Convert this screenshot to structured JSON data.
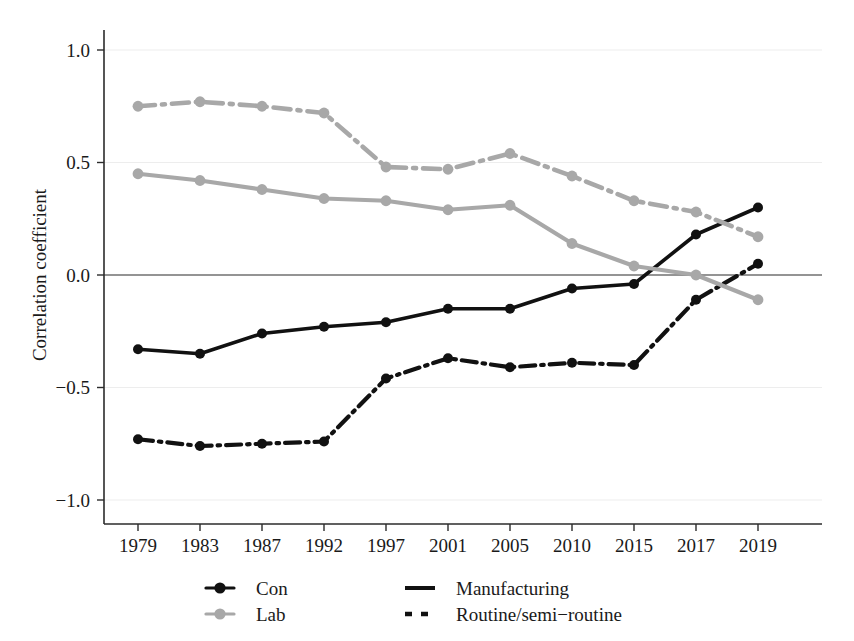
{
  "chart_data": {
    "type": "line",
    "title": "",
    "xlabel": "",
    "ylabel": "Correlation coefficient",
    "grid": true,
    "legend_position": "bottom",
    "categories": [
      "1979",
      "1983",
      "1987",
      "1992",
      "1997",
      "2001",
      "2005",
      "2010",
      "2015",
      "2017",
      "2019"
    ],
    "ylim": [
      -1.15,
      1.15
    ],
    "yticks": [
      "1.0",
      "0.5",
      "0.0",
      "-0.5",
      "-1.0"
    ],
    "ytick_values": [
      1.0,
      0.5,
      0.0,
      -0.5,
      -1.0
    ],
    "series": [
      {
        "name": "Con - Manufacturing",
        "party": "Con",
        "measure": "Manufacturing",
        "color": "#111111",
        "style": "solid",
        "values": [
          -0.33,
          -0.35,
          -0.26,
          -0.23,
          -0.21,
          -0.15,
          -0.15,
          -0.06,
          -0.04,
          0.18,
          0.3
        ]
      },
      {
        "name": "Con - Routine/semi-routine",
        "party": "Con",
        "measure": "Routine/semi-routine",
        "color": "#111111",
        "style": "dashdot",
        "values": [
          -0.73,
          -0.76,
          -0.75,
          -0.74,
          -0.46,
          -0.37,
          -0.41,
          -0.39,
          -0.4,
          -0.11,
          0.05
        ]
      },
      {
        "name": "Lab - Manufacturing",
        "party": "Lab",
        "measure": "Manufacturing",
        "color": "#a8a8a8",
        "style": "solid",
        "values": [
          0.45,
          0.42,
          0.38,
          0.34,
          0.33,
          0.29,
          0.31,
          0.14,
          0.04,
          0.0,
          -0.11
        ]
      },
      {
        "name": "Lab - Routine/semi-routine",
        "party": "Lab",
        "measure": "Routine/semi-routine",
        "color": "#a8a8a8",
        "style": "dashdot",
        "values": [
          0.75,
          0.77,
          0.75,
          0.72,
          0.48,
          0.47,
          0.54,
          0.44,
          0.33,
          0.28,
          0.17
        ]
      }
    ]
  },
  "axis": {
    "y_title": "Correlation coefficient",
    "y_ticks": [
      "1.0",
      "0.5",
      "0.0",
      "-0.5",
      "-1.0"
    ],
    "x_ticks": [
      "1979",
      "1983",
      "1987",
      "1992",
      "1997",
      "2001",
      "2005",
      "2010",
      "2015",
      "2017",
      "2019"
    ]
  },
  "legend": {
    "entries": [
      {
        "label": "Con",
        "key": "legend-con",
        "kind": "marker",
        "color": "#111111"
      },
      {
        "label": "Lab",
        "key": "legend-lab",
        "kind": "marker",
        "color": "#a8a8a8"
      },
      {
        "label": "Manufacturing",
        "key": "legend-manufacturing",
        "kind": "line-solid",
        "color": "#111111"
      },
      {
        "label": "Routine/semi-routine",
        "key": "legend-routine",
        "kind": "line-dashed",
        "color": "#111111"
      }
    ]
  },
  "colors": {
    "con": "#111111",
    "lab": "#a8a8a8",
    "axis": "#2b2b2b",
    "grid": "#ededed",
    "background": "#ffffff"
  }
}
